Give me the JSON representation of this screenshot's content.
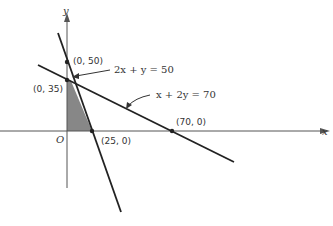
{
  "diagram": {
    "type": "linear-programming-feasible-region",
    "axes": {
      "x_label": "x",
      "y_label": "y",
      "origin_label": "O"
    },
    "lines": [
      {
        "equation": "2x + y = 50",
        "x_intercept": [
          25,
          0
        ],
        "y_intercept": [
          0,
          50
        ]
      },
      {
        "equation": "x + 2y = 70",
        "x_intercept": [
          70,
          0
        ],
        "y_intercept": [
          0,
          35
        ]
      }
    ],
    "points": [
      {
        "label": "(0, 50)"
      },
      {
        "label": "(0, 35)"
      },
      {
        "label": "(25, 0)"
      },
      {
        "label": "(70, 0)"
      }
    ],
    "shaded_region": {
      "vertices": [
        "(0, 0)",
        "(0, 35)",
        "intersection",
        "(25, 0)"
      ],
      "color": "#7a7a7a"
    },
    "colors": {
      "line": "#222222",
      "axis": "#555555",
      "shade": "#7a7a7a"
    }
  }
}
